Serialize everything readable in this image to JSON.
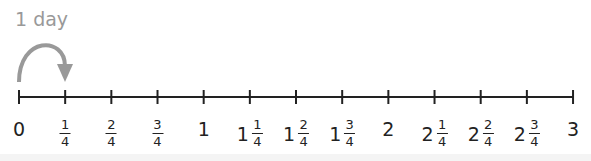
{
  "jump": {
    "label": "1 day",
    "from": 0,
    "to": 1,
    "color": "#999999"
  },
  "number_line": {
    "start": 0,
    "end": 3,
    "step": "1/4",
    "line_color": "#222222",
    "ticks": [
      {
        "whole": "0",
        "num": "",
        "den": ""
      },
      {
        "whole": "",
        "num": "1",
        "den": "4"
      },
      {
        "whole": "",
        "num": "2",
        "den": "4"
      },
      {
        "whole": "",
        "num": "3",
        "den": "4"
      },
      {
        "whole": "1",
        "num": "",
        "den": ""
      },
      {
        "whole": "1",
        "num": "1",
        "den": "4"
      },
      {
        "whole": "1",
        "num": "2",
        "den": "4"
      },
      {
        "whole": "1",
        "num": "3",
        "den": "4"
      },
      {
        "whole": "2",
        "num": "",
        "den": ""
      },
      {
        "whole": "2",
        "num": "1",
        "den": "4"
      },
      {
        "whole": "2",
        "num": "2",
        "den": "4"
      },
      {
        "whole": "2",
        "num": "3",
        "den": "4"
      },
      {
        "whole": "3",
        "num": "",
        "den": ""
      }
    ]
  }
}
